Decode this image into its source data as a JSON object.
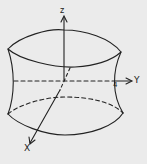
{
  "figure": {
    "axes": {
      "z_label": "z",
      "y_label": "Y",
      "x_label": "X"
    },
    "intercept_label": "4",
    "colors": {
      "background": "#ebebeb",
      "ink": "#222222"
    }
  }
}
